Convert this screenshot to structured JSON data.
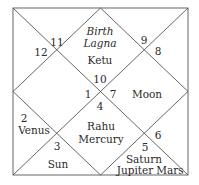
{
  "chart": {
    "line_color": "#555555",
    "houses": [
      {
        "house": 10,
        "sign": "10",
        "planets": [
          "Birth",
          "Lagna",
          "Ketu"
        ],
        "note_italic": [
          "Birth",
          "Lagna"
        ]
      },
      {
        "house": 11,
        "sign": "11",
        "planets": []
      },
      {
        "house": 12,
        "sign": "12",
        "planets": []
      },
      {
        "house": 1,
        "sign": "1",
        "planets": []
      },
      {
        "house": 2,
        "sign": "2",
        "planets": [
          "Venus"
        ]
      },
      {
        "house": 3,
        "sign": "3",
        "planets": [
          "Sun"
        ]
      },
      {
        "house": 4,
        "sign": "4",
        "planets": [
          "Rahu",
          "Mercury"
        ]
      },
      {
        "house": 5,
        "sign": "5",
        "planets": [
          "Saturn",
          "Jupiter",
          "Mars"
        ]
      },
      {
        "house": 6,
        "sign": "6",
        "planets": []
      },
      {
        "house": 7,
        "sign": "7",
        "planets": [
          "Moon"
        ]
      },
      {
        "house": 8,
        "sign": "8",
        "planets": []
      },
      {
        "house": 9,
        "sign": "9",
        "planets": []
      }
    ]
  },
  "labels": {
    "birth": "Birth",
    "lagna": "Lagna",
    "ketu": "Ketu",
    "n10": "10",
    "n11": "11",
    "n12": "12",
    "n9": "9",
    "n8": "8",
    "n1": "1",
    "n7": "7",
    "moon": "Moon",
    "n4": "4",
    "n2": "2",
    "venus": "Venus",
    "rahu": "Rahu",
    "mercury": "Mercury",
    "n3": "3",
    "n6": "6",
    "n5": "5",
    "sun": "Sun",
    "saturn": "Saturn",
    "jupiter": "Jupiter",
    "mars": "Mars"
  }
}
